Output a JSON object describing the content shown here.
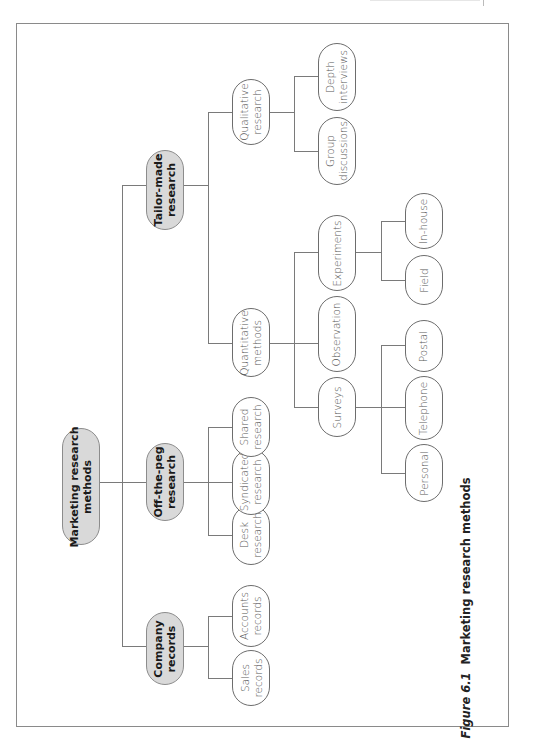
{
  "figure": {
    "number": "Figure 6.1",
    "title": "Marketing research methods",
    "orientation": "rotated 90° counter-clockwise"
  },
  "tree": {
    "root": "Marketing research\nmethods",
    "branches": [
      {
        "label": "Company\nrecords",
        "children": [
          "Sales\nrecords",
          "Accounts\nrecords"
        ]
      },
      {
        "label": "Off-the-peg\nresearch",
        "children": [
          "Desk\nresearch",
          "Syndicated\nresearch",
          "Shared\nresearch"
        ]
      },
      {
        "label": "Tailor-made\nresearch",
        "children": [
          {
            "label": "Quantitative\nmethods",
            "children": [
              {
                "label": "Surveys",
                "children": [
                  "Personal",
                  "Telephone",
                  "Postal"
                ]
              },
              {
                "label": "Observation",
                "children": []
              },
              {
                "label": "Experiments",
                "children": [
                  "Field",
                  "In-house"
                ]
              }
            ]
          },
          {
            "label": "Qualitative\nresearch",
            "children": [
              "Group\ndiscussions",
              "Depth\ninterviews"
            ]
          }
        ]
      }
    ]
  },
  "nodes": {
    "root": "Marketing research\nmethods",
    "company_records": "Company\nrecords",
    "sales_records": "Sales\nrecords",
    "accounts_records": "Accounts\nrecords",
    "off_the_peg": "Off-the-peg\nresearch",
    "desk_research": "Desk\nresearch",
    "syndicated_research": "Syndicated\nresearch",
    "shared_research": "Shared\nresearch",
    "tailor_made": "Tailor-made\nresearch",
    "quantitative": "Quantitative\nmethods",
    "qualitative": "Qualitative\nresearch",
    "surveys": "Surveys",
    "observation": "Observation",
    "experiments": "Experiments",
    "personal": "Personal",
    "telephone": "Telephone",
    "postal": "Postal",
    "field": "Field",
    "in_house": "In-house",
    "group_discussions": "Group\ndiscussions",
    "depth_interviews": "Depth\ninterviews"
  },
  "caption": {
    "number": "Figure 6.1",
    "title": "Marketing research methods"
  },
  "colors": {
    "main_node_fill": "#d9d9d9",
    "node_border": "#6d6d6d",
    "connector": "#7a7a7a",
    "frame": "#8a8a8a"
  }
}
